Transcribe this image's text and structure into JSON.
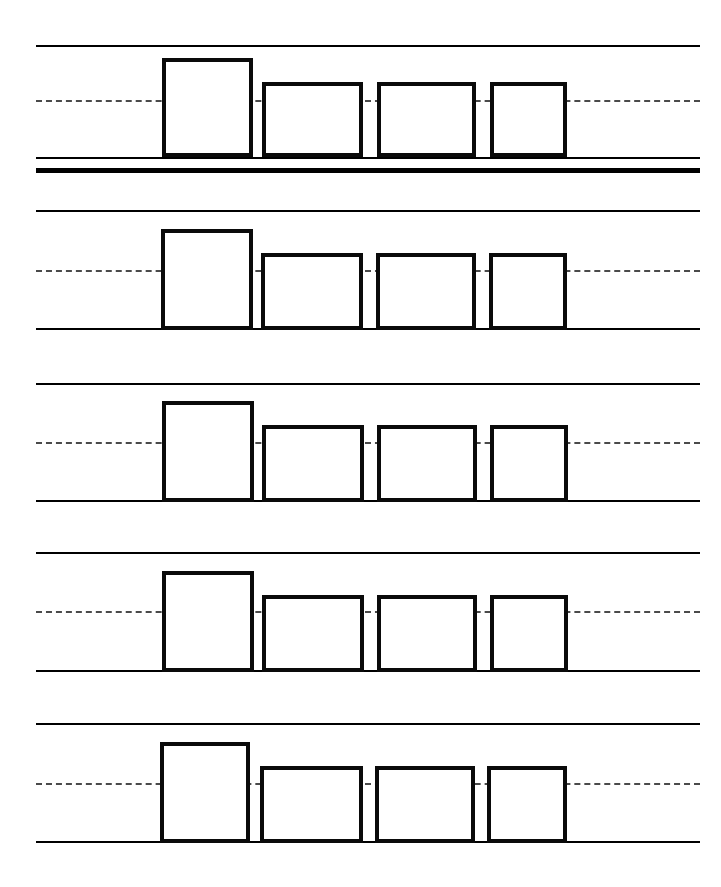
{
  "document": {
    "title": "Handwriting Practice Worksheet",
    "type": "ruled-practice-sheet",
    "background_color": "#ffffff",
    "ink_color": "#0a0a0a",
    "dash_color": "#4a4a4a",
    "width": 721,
    "height": 887
  },
  "ruling": {
    "line_left": 36,
    "line_right": 700,
    "topline_label": "top rule",
    "midline_label": "dashed mid rule",
    "baseline_label": "baseline rule",
    "thickline_label": "heavy separator rule",
    "dash_pattern": "12px dash, 7px gap",
    "topline_thickness": 2,
    "baseline_thickness": 2,
    "midline_thickness": 2,
    "thickline_thickness": 5
  },
  "rows": [
    {
      "index": 1,
      "top_y": 45,
      "mid_y": 100,
      "base_y": 157,
      "has_thick_separator": true,
      "thick_y": 168,
      "glyphs": [
        {
          "shape": "rectangle",
          "size": "tall",
          "x": 162,
          "y": 58,
          "w": 91,
          "h": 99
        },
        {
          "shape": "rectangle",
          "size": "short",
          "x": 262,
          "y": 82,
          "w": 101,
          "h": 75
        },
        {
          "shape": "rectangle",
          "size": "short",
          "x": 377,
          "y": 82,
          "w": 99,
          "h": 75
        },
        {
          "shape": "rectangle",
          "size": "short",
          "x": 490,
          "y": 82,
          "w": 77,
          "h": 75
        }
      ]
    },
    {
      "index": 2,
      "top_y": 210,
      "mid_y": 270,
      "base_y": 328,
      "has_thick_separator": false,
      "thick_y": null,
      "glyphs": [
        {
          "shape": "rectangle",
          "size": "tall",
          "x": 161,
          "y": 229,
          "w": 92,
          "h": 101
        },
        {
          "shape": "rectangle",
          "size": "short",
          "x": 261,
          "y": 253,
          "w": 102,
          "h": 77
        },
        {
          "shape": "rectangle",
          "size": "short",
          "x": 376,
          "y": 253,
          "w": 100,
          "h": 77
        },
        {
          "shape": "rectangle",
          "size": "short",
          "x": 489,
          "y": 253,
          "w": 78,
          "h": 77
        }
      ]
    },
    {
      "index": 3,
      "top_y": 383,
      "mid_y": 442,
      "base_y": 500,
      "has_thick_separator": false,
      "thick_y": null,
      "glyphs": [
        {
          "shape": "rectangle",
          "size": "tall",
          "x": 162,
          "y": 401,
          "w": 92,
          "h": 101
        },
        {
          "shape": "rectangle",
          "size": "short",
          "x": 262,
          "y": 425,
          "w": 102,
          "h": 77
        },
        {
          "shape": "rectangle",
          "size": "short",
          "x": 377,
          "y": 425,
          "w": 100,
          "h": 77
        },
        {
          "shape": "rectangle",
          "size": "short",
          "x": 490,
          "y": 425,
          "w": 78,
          "h": 77
        }
      ]
    },
    {
      "index": 4,
      "top_y": 552,
      "mid_y": 611,
      "base_y": 670,
      "has_thick_separator": false,
      "thick_y": null,
      "glyphs": [
        {
          "shape": "rectangle",
          "size": "tall",
          "x": 162,
          "y": 571,
          "w": 92,
          "h": 101
        },
        {
          "shape": "rectangle",
          "size": "short",
          "x": 262,
          "y": 595,
          "w": 102,
          "h": 77
        },
        {
          "shape": "rectangle",
          "size": "short",
          "x": 377,
          "y": 595,
          "w": 100,
          "h": 77
        },
        {
          "shape": "rectangle",
          "size": "short",
          "x": 490,
          "y": 595,
          "w": 78,
          "h": 77
        }
      ]
    },
    {
      "index": 5,
      "top_y": 723,
      "mid_y": 783,
      "base_y": 841,
      "has_thick_separator": false,
      "thick_y": null,
      "glyphs": [
        {
          "shape": "rectangle",
          "size": "tall",
          "x": 160,
          "y": 742,
          "w": 90,
          "h": 101
        },
        {
          "shape": "rectangle",
          "size": "short",
          "x": 260,
          "y": 766,
          "w": 103,
          "h": 77
        },
        {
          "shape": "rectangle",
          "size": "short",
          "x": 375,
          "y": 766,
          "w": 100,
          "h": 77
        },
        {
          "shape": "rectangle",
          "size": "short",
          "x": 487,
          "y": 766,
          "w": 80,
          "h": 77
        }
      ]
    }
  ]
}
